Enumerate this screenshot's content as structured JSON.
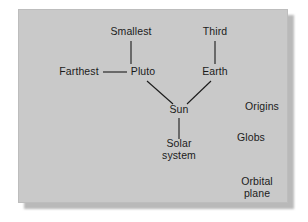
{
  "diagram": {
    "type": "concept-map",
    "background_color": "#c9c9c9",
    "text_color": "#1b1b1b",
    "line_color": "#1b1b1b",
    "nodes": [
      {
        "id": "smallest",
        "label": "Smallest",
        "x": 112,
        "y": 22,
        "connected": true
      },
      {
        "id": "third",
        "label": "Third",
        "x": 196,
        "y": 22,
        "connected": true
      },
      {
        "id": "farthest",
        "label": "Farthest",
        "x": 60,
        "y": 62,
        "connected": true
      },
      {
        "id": "pluto",
        "label": "Pluto",
        "x": 124,
        "y": 62,
        "connected": true
      },
      {
        "id": "earth",
        "label": "Earth",
        "x": 196,
        "y": 62,
        "connected": true
      },
      {
        "id": "sun",
        "label": "Sun",
        "x": 160,
        "y": 100,
        "connected": true
      },
      {
        "id": "solarsystem",
        "label": "Solar\nsystem",
        "x": 160,
        "y": 139,
        "connected": true
      },
      {
        "id": "origins",
        "label": "Origins",
        "x": 243,
        "y": 97,
        "connected": false
      },
      {
        "id": "globs",
        "label": "Globs",
        "x": 232,
        "y": 128,
        "connected": false
      },
      {
        "id": "orbitalplane",
        "label": "Orbital\nplane",
        "x": 238,
        "y": 177,
        "connected": false
      }
    ],
    "edges": [
      {
        "id": "edge-smallest-pluto",
        "from": "smallest",
        "to": "pluto",
        "x1": 112,
        "y1": 31,
        "x2": 112,
        "y2": 54
      },
      {
        "id": "edge-third-earth",
        "from": "third",
        "to": "earth",
        "x1": 196,
        "y1": 31,
        "x2": 196,
        "y2": 54
      },
      {
        "id": "edge-farthest-pluto",
        "from": "farthest",
        "to": "pluto",
        "x1": 84,
        "y1": 62,
        "x2": 108,
        "y2": 62
      },
      {
        "id": "edge-pluto-sun",
        "from": "pluto",
        "to": "sun",
        "x1": 128,
        "y1": 71,
        "x2": 154,
        "y2": 94
      },
      {
        "id": "edge-earth-sun",
        "from": "earth",
        "to": "sun",
        "x1": 192,
        "y1": 71,
        "x2": 168,
        "y2": 94
      },
      {
        "id": "edge-sun-solar",
        "from": "sun",
        "to": "solarsystem",
        "x1": 160,
        "y1": 108,
        "x2": 160,
        "y2": 129
      }
    ]
  }
}
